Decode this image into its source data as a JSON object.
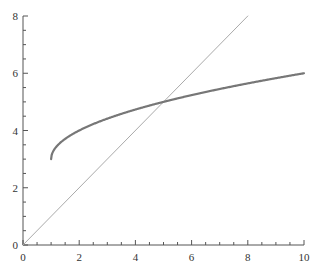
{
  "chart_data": {
    "type": "line",
    "title": "",
    "xlabel": "",
    "ylabel": "",
    "xlim": [
      0,
      10
    ],
    "ylim": [
      0,
      8
    ],
    "grid": false,
    "legend": null,
    "x_ticks": [
      "0",
      "2",
      "4",
      "6",
      "8",
      "10"
    ],
    "y_ticks": [
      "0",
      "2",
      "4",
      "6",
      "8"
    ],
    "series": [
      {
        "name": "y = x",
        "color": "#aaaaaa",
        "x": [
          0,
          8
        ],
        "y": [
          0,
          8
        ]
      },
      {
        "name": "y = 3 + sqrt(x - 1)",
        "color": "#777777",
        "x": [
          1,
          1.25,
          1.5,
          2,
          3,
          4,
          5,
          6,
          7,
          8,
          9,
          10
        ],
        "y": [
          3,
          3.5,
          3.71,
          4,
          4.41,
          4.73,
          5,
          5.24,
          5.45,
          5.65,
          5.83,
          6
        ]
      }
    ]
  }
}
